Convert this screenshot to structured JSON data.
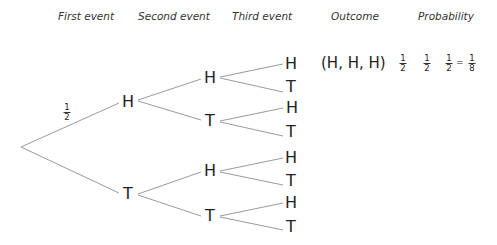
{
  "headers": {
    "first": "First event",
    "second": "Second event",
    "third": "Third event",
    "outcome": "Outcome",
    "probability": "Probability"
  },
  "tree": {
    "root_branch_label": {
      "num": "1",
      "den": "2"
    },
    "first_level": [
      "H",
      "T"
    ],
    "second_level": [
      "H",
      "T",
      "H",
      "T"
    ],
    "third_level": [
      "H",
      "T",
      "H",
      "T",
      "H",
      "T",
      "H",
      "T"
    ]
  },
  "outcome_row": {
    "outcome": "(H, H, H)",
    "factors": [
      {
        "num": "1",
        "den": "2"
      },
      {
        "num": "1",
        "den": "2"
      },
      {
        "num": "1",
        "den": "2"
      }
    ],
    "equals": "=",
    "result": {
      "num": "1",
      "den": "8"
    }
  },
  "colors": {
    "line": "#9a9a9a",
    "text": "#222222"
  }
}
